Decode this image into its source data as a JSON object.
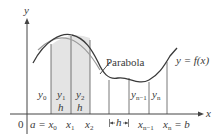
{
  "figure": {
    "type": "Simpson's rule diagram",
    "axes": {
      "x_label": "x",
      "y_label": "y",
      "origin_label": "0"
    },
    "curve_label": "y = f(x)",
    "parabola_label": "Parabola",
    "ordinates": [
      {
        "base": "y",
        "sub": "0"
      },
      {
        "base": "y",
        "sub": "1"
      },
      {
        "base": "y",
        "sub": "2"
      },
      {
        "base": "y",
        "sub": "n−1"
      },
      {
        "base": "y",
        "sub": "n"
      }
    ],
    "x_ticks": [
      {
        "text": "a = x",
        "sub": "0"
      },
      {
        "text": "x",
        "sub": "1"
      },
      {
        "text": "x",
        "sub": "2"
      },
      {
        "text": "x",
        "sub": "n−1"
      },
      {
        "text": "x",
        "sub": "n",
        "suffix": " = b"
      }
    ],
    "width_labels": [
      "h",
      "h",
      "h"
    ],
    "colors": {
      "axis": "#444444",
      "curve": "#3a3a3a",
      "parabola": "#9a9a9a",
      "shade": "#e4e4e4",
      "gridline": "#555555"
    }
  }
}
